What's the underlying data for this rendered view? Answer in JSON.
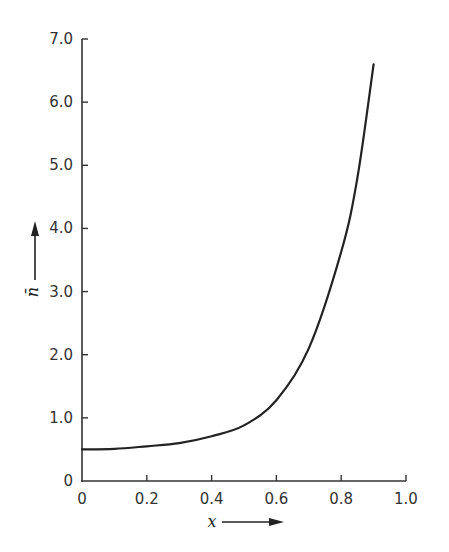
{
  "chart_data": {
    "type": "line",
    "title": "",
    "xlabel": "x",
    "ylabel": "n̄",
    "xlim": [
      0,
      1.0
    ],
    "ylim": [
      0,
      7.0
    ],
    "grid": false,
    "legend": null,
    "x_ticks": [
      "0",
      "0.2",
      "0.4",
      "0.6",
      "0.8",
      "1.0"
    ],
    "y_ticks": [
      "0",
      "1.0",
      "2.0",
      "3.0",
      "4.0",
      "5.0",
      "6.0",
      "7.0"
    ],
    "axis_arrows": {
      "x": "right",
      "y": "up"
    },
    "series": [
      {
        "name": "n̄(x)",
        "x": [
          0.0,
          0.1,
          0.2,
          0.3,
          0.4,
          0.5,
          0.6,
          0.7,
          0.8,
          0.85,
          0.9
        ],
        "values": [
          0.5,
          0.51,
          0.55,
          0.6,
          0.71,
          0.88,
          1.28,
          2.1,
          3.63,
          4.8,
          6.6
        ]
      }
    ]
  },
  "colors": {
    "line": "#222222",
    "axis": "#333333",
    "background": "#ffffff"
  }
}
